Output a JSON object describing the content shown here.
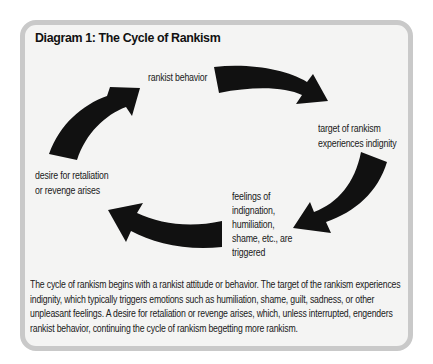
{
  "diagram": {
    "title": "Diagram 1: The Cycle of Rankism",
    "nodes": [
      {
        "id": "rankist-behavior",
        "lines": [
          "rankist behavior"
        ]
      },
      {
        "id": "target-indignity",
        "lines": [
          "target of rankism",
          "experiences indignity"
        ]
      },
      {
        "id": "feelings-triggered",
        "lines": [
          "feelings of",
          "indignation,",
          "humiliation,",
          "shame, etc., are",
          "triggered"
        ]
      },
      {
        "id": "desire-retaliation",
        "lines": [
          "desire for retaliation",
          "or revenge arises"
        ]
      }
    ],
    "edges": [
      {
        "from": "rankist-behavior",
        "to": "target-indignity"
      },
      {
        "from": "target-indignity",
        "to": "feelings-triggered"
      },
      {
        "from": "feelings-triggered",
        "to": "desire-retaliation"
      },
      {
        "from": "desire-retaliation",
        "to": "rankist-behavior"
      }
    ],
    "caption_lines": [
      "The cycle of rankism begins with a rankist attitude or behavior. The target of the rankism experiences",
      "indignity, which typically triggers emotions such as humiliation, shame, guilt, sadness, or other",
      "unpleasant feelings. A desire for retaliation or revenge arises, which, unless interrupted, engenders",
      "rankist behavior, continuing the cycle of rankism begetting more rankism."
    ],
    "colors": {
      "arrow": "#111111",
      "border": "#c9c9c9",
      "panel": "#f4f4f3"
    }
  }
}
